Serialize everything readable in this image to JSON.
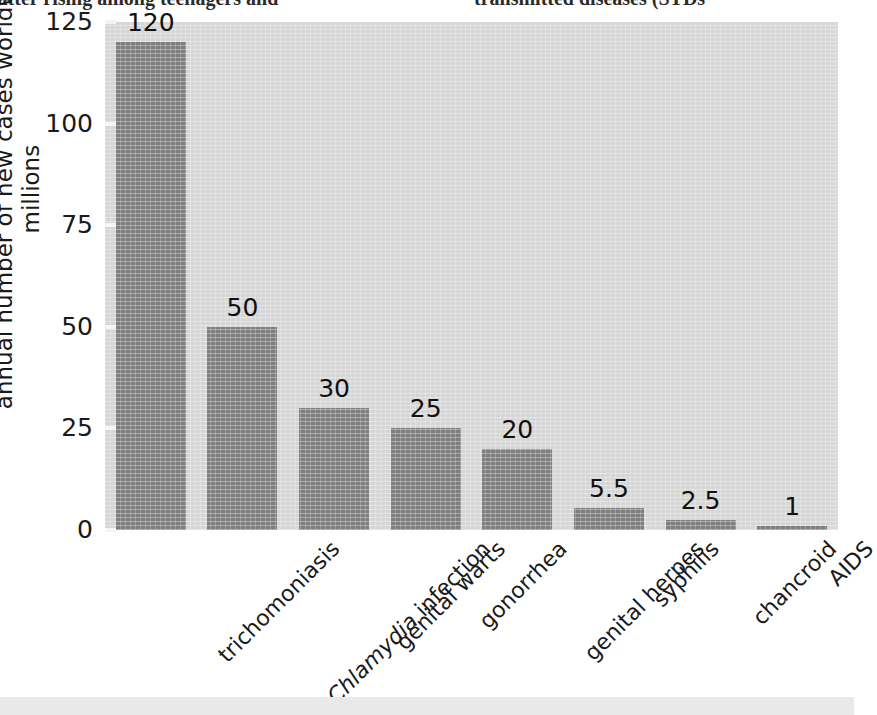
{
  "page_text": {
    "left_fragment": "latter rising among teenagers and",
    "right_fragment": "transmitted diseases (STDs"
  },
  "colors": {
    "bar": "#7f7f7f",
    "plot_background": "#d6d6d6",
    "page_background": "#ffffff",
    "text": "#1a1a1a"
  },
  "chart_data": {
    "type": "bar",
    "title": "",
    "xlabel": "",
    "ylabel": "annual number of new cases worldwide",
    "ylabel_line2": "millions",
    "ylim": [
      0,
      125
    ],
    "yticks": [
      125,
      100,
      75,
      50,
      25,
      0
    ],
    "grid": false,
    "legend": "none",
    "categories": [
      "trichomoniasis",
      "Chlamydia infection",
      "genital warts",
      "gonorrhea",
      "genital herpes",
      "syphilis",
      "chancroid",
      "AIDS"
    ],
    "category_italic_prefix": [
      "",
      "Chlamydia",
      "",
      "",
      "",
      "",
      "",
      ""
    ],
    "values": [
      120,
      50,
      30,
      25,
      20,
      5.5,
      2.5,
      1
    ],
    "value_labels": [
      "120",
      "50",
      "30",
      "25",
      "20",
      "5.5",
      "2.5",
      "1"
    ]
  }
}
